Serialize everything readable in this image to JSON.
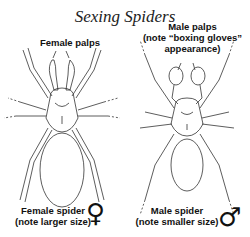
{
  "title": "Sexing Spiders",
  "female": {
    "palps_label": "Female palps",
    "spider_label_line1": "Female spider",
    "spider_label_line2": "(note larger size)",
    "symbol": "♀"
  },
  "male": {
    "palps_label_line1": "Male palps",
    "palps_label_line2": "(note “boxing gloves”",
    "palps_label_line3": "appearance)",
    "spider_label_line1": "Male spider",
    "spider_label_line2": "(note smaller size)",
    "symbol": "♂"
  },
  "colors": {
    "line": "#333333",
    "text": "#111111",
    "background": "#ffffff"
  }
}
